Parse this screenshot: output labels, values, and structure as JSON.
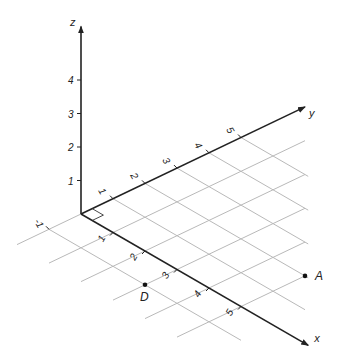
{
  "diagram": {
    "projection": {
      "origin": [
        81,
        214
      ],
      "x_unit": [
        32,
        18.5
      ],
      "y_unit": [
        32,
        -15.3
      ],
      "z_unit": [
        0,
        -33.5
      ]
    },
    "axes": {
      "x": {
        "label": "x",
        "end": 7.1,
        "ticks": [
          1,
          2,
          3,
          4,
          5
        ]
      },
      "y": {
        "label": "y",
        "end": 7.0,
        "neg_extent": -2,
        "ticks": [
          -1,
          1,
          2,
          3,
          4,
          5
        ]
      },
      "z": {
        "label": "z",
        "end": 5.6,
        "ticks": [
          1,
          2,
          3,
          4
        ]
      }
    },
    "grid": {
      "lines_const_x": {
        "values": [
          1,
          2,
          3,
          4,
          5
        ],
        "y_from": -2,
        "y_to_formula": "7 - x"
      },
      "lines_const_y": {
        "values": [
          -1,
          1,
          2,
          3,
          4,
          5
        ],
        "x_from": 0,
        "x_to_max": 6,
        "x_to_formula": "7.1 - y"
      }
    },
    "points": [
      {
        "name": "A",
        "coords": [
          5,
          2,
          0
        ],
        "label_offset": [
          10,
          4
        ]
      },
      {
        "name": "D",
        "coords": [
          3,
          -1,
          0
        ],
        "label_offset": [
          -5,
          16
        ]
      }
    ],
    "colors": {
      "axis": "#222222",
      "grid": "#b9b9b9",
      "background": "#ffffff"
    }
  }
}
